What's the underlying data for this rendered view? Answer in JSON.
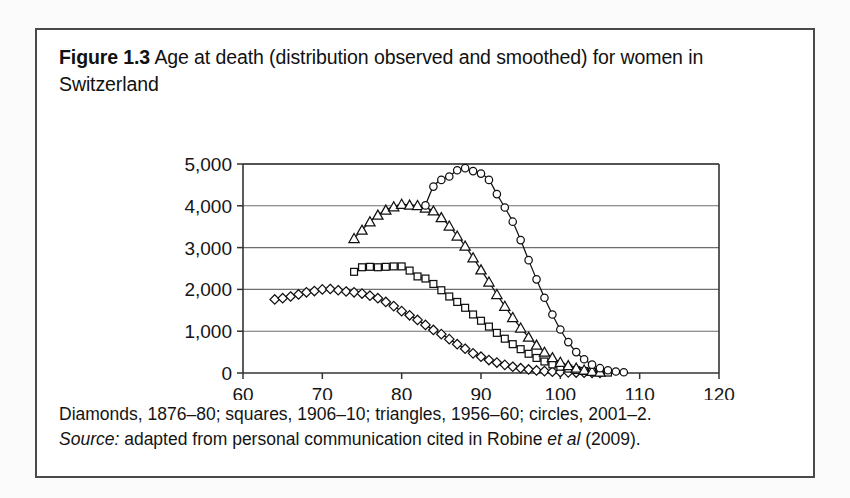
{
  "figure": {
    "number_label": "Figure 1.3",
    "title_text": "Age at death (distribution observed and smoothed) for women in Switzerland",
    "caption_line1": "Diamonds, 1876–80; squares, 1906–10; triangles, 1956–60; circles, 2001–2.",
    "caption_source_label": "Source:",
    "caption_source_rest_a": " adapted from personal communication cited in Robine ",
    "caption_source_italic": "et al",
    "caption_source_rest_b": " (2009)."
  },
  "colors": {
    "frame": "#4a4a4a",
    "axis": "#333333",
    "gridline": "#6e6e6e",
    "marker_stroke": "#111111",
    "curve": "#111111",
    "page_background": "#fbfbfb",
    "figure_background": "#ffffff"
  },
  "chart_data": {
    "type": "scatter",
    "title": "Age at death (distribution observed and smoothed) for women in Switzerland",
    "xlabel": "Age (years)",
    "ylabel": "",
    "xlim": [
      60,
      120
    ],
    "ylim": [
      0,
      5000
    ],
    "xticks": [
      60,
      70,
      80,
      90,
      100,
      110,
      120
    ],
    "xtick_labels": [
      "60",
      "70",
      "80",
      "90",
      "100",
      "110",
      "120"
    ],
    "yticks": [
      0,
      1000,
      2000,
      3000,
      4000,
      5000
    ],
    "ytick_labels": [
      "0",
      "1,000",
      "2,000",
      "3,000",
      "4,000",
      "5,000"
    ],
    "grid": "horizontal",
    "legend_position": "caption",
    "series": [
      {
        "name": "Diamonds, 1876–80",
        "marker": "diamond",
        "x": [
          64,
          65,
          66,
          67,
          68,
          69,
          70,
          71,
          72,
          73,
          74,
          75,
          76,
          77,
          78,
          79,
          80,
          81,
          82,
          83,
          84,
          85,
          86,
          87,
          88,
          89,
          90,
          91,
          92,
          93,
          94,
          95,
          96,
          97,
          98,
          99,
          100,
          101,
          102,
          103,
          104,
          105
        ],
        "y": [
          1760,
          1790,
          1830,
          1880,
          1930,
          1960,
          2000,
          2010,
          1980,
          1950,
          1930,
          1900,
          1850,
          1790,
          1700,
          1600,
          1480,
          1380,
          1270,
          1150,
          1030,
          930,
          810,
          690,
          580,
          470,
          390,
          310,
          250,
          195,
          150,
          115,
          85,
          62,
          45,
          32,
          22,
          15,
          10,
          6,
          4,
          2
        ]
      },
      {
        "name": "Squares, 1906–10",
        "marker": "square",
        "x": [
          74,
          75,
          76,
          77,
          78,
          79,
          80,
          81,
          82,
          83,
          84,
          85,
          86,
          87,
          88,
          89,
          90,
          91,
          92,
          93,
          94,
          95,
          96,
          97,
          98,
          99,
          100,
          101,
          102,
          103,
          104,
          105,
          106
        ],
        "y": [
          2420,
          2530,
          2540,
          2530,
          2540,
          2550,
          2550,
          2450,
          2310,
          2260,
          2130,
          1980,
          1830,
          1700,
          1560,
          1400,
          1250,
          1110,
          960,
          820,
          690,
          570,
          460,
          360,
          275,
          205,
          150,
          105,
          72,
          48,
          30,
          18,
          10
        ]
      },
      {
        "name": "Triangles, 1956–60",
        "marker": "triangle",
        "x": [
          74,
          75,
          76,
          77,
          78,
          79,
          80,
          81,
          82,
          83,
          84,
          85,
          86,
          87,
          88,
          89,
          90,
          91,
          92,
          93,
          94,
          95,
          96,
          97,
          98,
          99,
          100,
          101,
          102,
          103,
          104,
          105
        ],
        "y": [
          3220,
          3420,
          3620,
          3780,
          3900,
          3980,
          4040,
          4020,
          4010,
          3950,
          3880,
          3720,
          3520,
          3280,
          3040,
          2760,
          2470,
          2180,
          1880,
          1600,
          1330,
          1080,
          860,
          670,
          500,
          370,
          260,
          180,
          120,
          75,
          45,
          25
        ]
      },
      {
        "name": "Circles, 2001–2",
        "marker": "circle",
        "x": [
          83,
          84,
          85,
          86,
          87,
          88,
          89,
          90,
          91,
          92,
          93,
          94,
          95,
          96,
          97,
          98,
          99,
          100,
          101,
          102,
          103,
          104,
          105,
          106,
          107,
          108
        ],
        "y": [
          4010,
          4460,
          4620,
          4700,
          4850,
          4900,
          4830,
          4770,
          4620,
          4280,
          3960,
          3620,
          3180,
          2700,
          2240,
          1800,
          1400,
          1040,
          740,
          500,
          330,
          200,
          115,
          65,
          35,
          18
        ]
      }
    ]
  }
}
